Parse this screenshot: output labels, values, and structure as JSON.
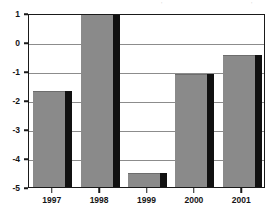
{
  "chart_data": {
    "type": "bar",
    "title": "",
    "xlabel": "",
    "ylabel": "",
    "categories": [
      "1997",
      "1998",
      "1999",
      "2000",
      "2001"
    ],
    "values": [
      -1.7,
      1.0,
      -4.5,
      -1.1,
      -0.45
    ],
    "ylim": [
      -5,
      1
    ],
    "yticks": [
      1,
      0,
      -1,
      -2,
      -3,
      -4,
      -5
    ],
    "ytick_labels": [
      "1",
      "0",
      "-1",
      "-2",
      "-3",
      "-4",
      "-5"
    ],
    "grid": true,
    "legend": null,
    "bar_color": "#8a8a8a",
    "bar_shadow_color": "#111111",
    "axis_color": "#1a1a1a",
    "gridline_color": "#8c8c8c"
  },
  "artifacts": {
    "top_left_mark": "'",
    "top_right_mark": "'"
  }
}
